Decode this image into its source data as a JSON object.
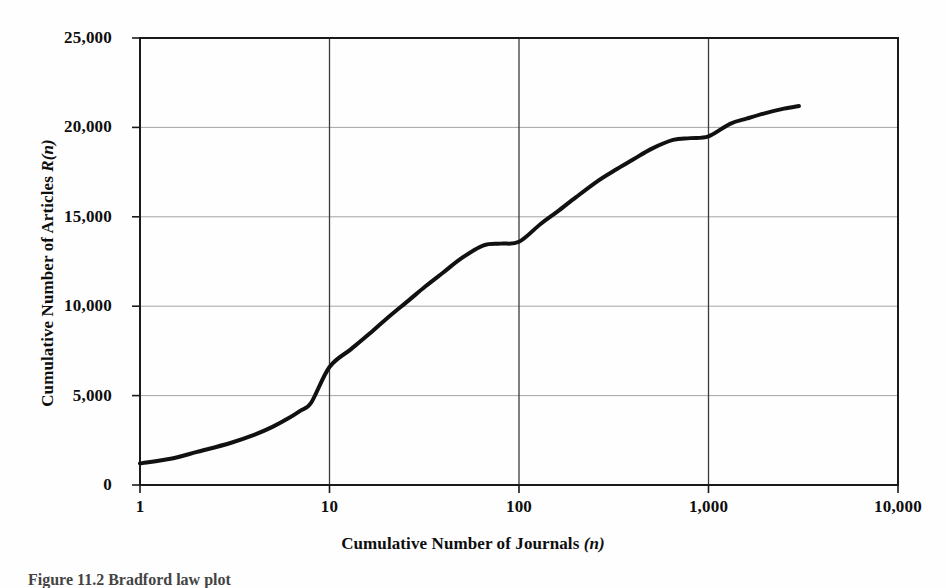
{
  "figure": {
    "caption": "Figure 11.2   Bradford law plot"
  },
  "axes": {
    "x_title_main": "Cumulative Number of Journals ",
    "x_title_var": "(n)",
    "y_title_main": "Cumulative Number of Articles ",
    "y_title_var": "R(n)",
    "x_tick_labels": [
      "1",
      "10",
      "100",
      "1,000",
      "10,000"
    ],
    "y_tick_labels": [
      "0",
      "5,000",
      "10,000",
      "15,000",
      "20,000",
      "25,000"
    ]
  },
  "style": {
    "curve_color": "#111111",
    "frame_color": "#1a1a1a",
    "grid_color": "#9a9a9a",
    "background": "#fefefe"
  },
  "chart_data": {
    "type": "line",
    "title": "",
    "subtitle": "",
    "xlabel": "Cumulative Number of Journals (n)",
    "ylabel": "Cumulative Number of Articles R(n)",
    "xscale": "log",
    "yscale": "linear",
    "xlim": [
      1,
      10000
    ],
    "ylim": [
      0,
      25000
    ],
    "xticks": [
      1,
      10,
      100,
      1000,
      10000
    ],
    "xtick_labels": [
      "1",
      "10",
      "100",
      "1,000",
      "10,000"
    ],
    "yticks": [
      0,
      5000,
      10000,
      15000,
      20000,
      25000
    ],
    "ytick_labels": [
      "0",
      "5,000",
      "10,000",
      "15,000",
      "20,000",
      "25,000"
    ],
    "grid": "horizontal-and-vertical",
    "legend": "none",
    "annotations": [],
    "series": [
      {
        "name": "Cumulative articles R(n)",
        "color": "#111111",
        "linewidth": 4,
        "x": [
          1,
          1.5,
          2,
          3,
          4,
          5,
          6,
          7,
          8,
          10,
          13,
          16,
          20,
          26,
          32,
          40,
          50,
          65,
          80,
          100,
          130,
          160,
          200,
          260,
          320,
          400,
          500,
          650,
          800,
          1000,
          1300,
          1600,
          2000,
          2500,
          3000
        ],
        "y": [
          1200,
          1500,
          1850,
          2350,
          2800,
          3250,
          3700,
          4150,
          4600,
          6600,
          7600,
          8400,
          9300,
          10300,
          11100,
          11900,
          12700,
          13400,
          13500,
          13600,
          14600,
          15300,
          16100,
          17000,
          17600,
          18200,
          18800,
          19300,
          19400,
          19500,
          20200,
          20500,
          20800,
          21050,
          21200
        ]
      }
    ]
  }
}
